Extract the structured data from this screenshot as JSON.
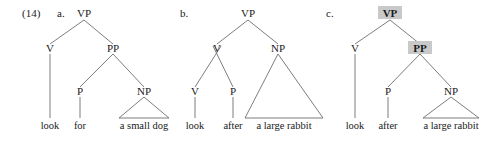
{
  "figure": {
    "number": "(14)",
    "background_color": "#ffffff",
    "line_color": "#6e6e6e",
    "text_color": "#1a1a1a",
    "highlight_color": "#c9c9c9"
  },
  "trees": [
    {
      "letter": "a.",
      "sentence": "look for a small dog",
      "nodes": {
        "root": "VP",
        "v": "V",
        "pp": "PP",
        "p": "P",
        "np": "NP"
      },
      "terminals": {
        "verb": "look",
        "prep": "for",
        "np_phrase": "a small dog"
      },
      "bold_nodes": []
    },
    {
      "letter": "b.",
      "sentence": "look after a large rabbit",
      "nodes": {
        "root": "VP",
        "v_complex": "V",
        "v": "V",
        "p": "P",
        "np": "NP"
      },
      "terminals": {
        "verb": "look",
        "prep": "after",
        "np_phrase": "a large rabbit"
      },
      "bold_nodes": []
    },
    {
      "letter": "c.",
      "sentence": "look after a large rabbit",
      "nodes": {
        "root": "VP",
        "v": "V",
        "pp": "PP",
        "p": "P",
        "np": "NP"
      },
      "terminals": {
        "verb": "look",
        "prep": "after",
        "np_phrase": "a large rabbit"
      },
      "bold_nodes": [
        "VP",
        "PP"
      ]
    }
  ]
}
